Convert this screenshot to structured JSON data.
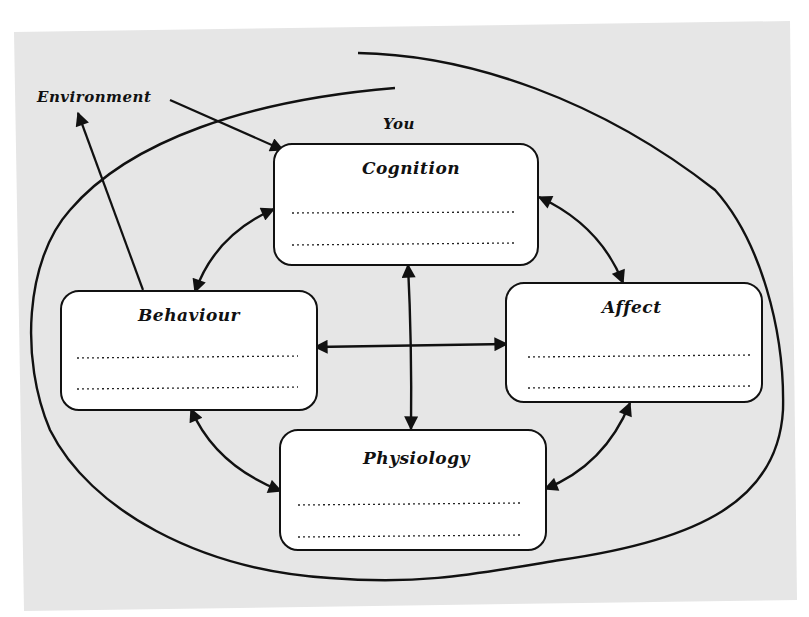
{
  "diagram": {
    "title_label": "You",
    "environment_label": "Environment",
    "colors": {
      "background": "#e6e6e6",
      "page": "#ffffff",
      "box_fill": "#ffffff",
      "stroke": "#111111"
    },
    "boxes": [
      {
        "id": "cognition",
        "label": "Cognition",
        "x": 274,
        "y": 144,
        "w": 264,
        "h": 121,
        "title_x": 362,
        "title_y": 160,
        "lines_y": [
          213,
          244
        ]
      },
      {
        "id": "behaviour",
        "label": "Behaviour",
        "x": 61,
        "y": 291,
        "w": 256,
        "h": 119,
        "title_x": 138,
        "title_y": 307,
        "lines_y": [
          357,
          388
        ]
      },
      {
        "id": "affect",
        "label": "Affect",
        "x": 506,
        "y": 283,
        "w": 256,
        "h": 119,
        "title_x": 602,
        "title_y": 298,
        "lines_y": [
          356,
          387
        ]
      },
      {
        "id": "physiology",
        "label": "Physiology",
        "x": 280,
        "y": 430,
        "w": 266,
        "h": 120,
        "title_x": 363,
        "title_y": 450,
        "lines_y": [
          505,
          536
        ]
      }
    ],
    "arrows": [
      {
        "from": "cognition",
        "to": "behaviour",
        "type": "double-curved"
      },
      {
        "from": "cognition",
        "to": "affect",
        "type": "double-curved"
      },
      {
        "from": "behaviour",
        "to": "physiology",
        "type": "double-curved"
      },
      {
        "from": "affect",
        "to": "physiology",
        "type": "double-curved"
      },
      {
        "from": "cognition",
        "to": "physiology",
        "type": "double-straight"
      },
      {
        "from": "behaviour",
        "to": "affect",
        "type": "double-straight"
      },
      {
        "from": "environment",
        "to": "cognition",
        "type": "single"
      },
      {
        "from": "behaviour",
        "to": "environment",
        "type": "single"
      }
    ]
  }
}
